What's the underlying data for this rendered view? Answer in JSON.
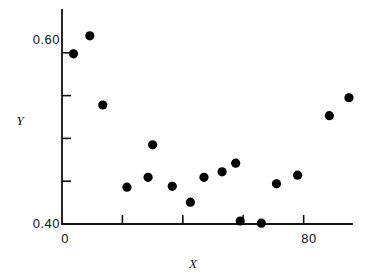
{
  "chart_data": {
    "type": "scatter",
    "title": "",
    "xlabel": "X",
    "ylabel": "Y",
    "xlim": [
      0,
      96
    ],
    "ylim": [
      0.4,
      0.65
    ],
    "grid": false,
    "legend": null,
    "x_ticks": [
      0,
      20,
      40,
      60,
      80
    ],
    "x_tick_labels": [
      "0",
      "",
      "",
      "",
      "80"
    ],
    "y_ticks": [
      0.4,
      0.45,
      0.5,
      0.55,
      0.6
    ],
    "y_tick_labels": [
      "0.40",
      "",
      "",
      "",
      "0.60"
    ],
    "points": [
      {
        "x": 3.8,
        "y": 0.5988
      },
      {
        "x": 9.2,
        "y": 0.6198
      },
      {
        "x": 13.5,
        "y": 0.539
      },
      {
        "x": 30.0,
        "y": 0.4925
      },
      {
        "x": 21.5,
        "y": 0.443
      },
      {
        "x": 28.5,
        "y": 0.4545
      },
      {
        "x": 36.5,
        "y": 0.444
      },
      {
        "x": 42.5,
        "y": 0.4255
      },
      {
        "x": 47.0,
        "y": 0.4545
      },
      {
        "x": 53.0,
        "y": 0.461
      },
      {
        "x": 57.5,
        "y": 0.471
      },
      {
        "x": 59.0,
        "y": 0.4035
      },
      {
        "x": 66.0,
        "y": 0.401
      },
      {
        "x": 71.0,
        "y": 0.447
      },
      {
        "x": 78.0,
        "y": 0.457
      },
      {
        "x": 88.5,
        "y": 0.5265
      },
      {
        "x": 95.0,
        "y": 0.5475
      }
    ]
  },
  "axes": {
    "x_title": "X",
    "y_title": "Y",
    "y_label_top": "0.60",
    "y_label_bottom": "0.40",
    "x_label_origin": "0",
    "x_label_right": "80"
  }
}
